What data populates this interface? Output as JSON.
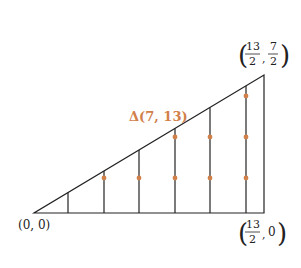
{
  "diagram": {
    "title_label": "Δ(7, 13)",
    "accent_color": "#d2804a",
    "line_color": "#222222",
    "vertices": {
      "origin": {
        "label": "(0, 0)",
        "x": 0,
        "y": 0
      },
      "top_right": {
        "label_num_x": "13",
        "label_den_x": "2",
        "label_num_y": "7",
        "label_den_y": "2",
        "x": 6.5,
        "y": 3.5
      },
      "bottom_right": {
        "label_num_x": "13",
        "label_den_x": "2",
        "label_y": "0",
        "x": 6.5,
        "y": 0
      }
    },
    "vertical_lines_x": [
      1,
      2,
      3,
      4,
      5,
      6
    ],
    "lattice_points": [
      {
        "x": 2,
        "y": 1
      },
      {
        "x": 3,
        "y": 1
      },
      {
        "x": 4,
        "y": 1
      },
      {
        "x": 4,
        "y": 2
      },
      {
        "x": 5,
        "y": 1
      },
      {
        "x": 5,
        "y": 2
      },
      {
        "x": 6,
        "y": 1
      },
      {
        "x": 6,
        "y": 2
      },
      {
        "x": 6,
        "y": 3
      }
    ]
  }
}
